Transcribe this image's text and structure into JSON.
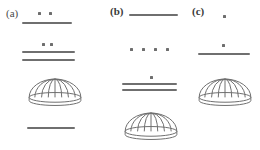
{
  "figure": {
    "stroke_color": "#6f6f6f",
    "dot_color": "#6e6e6e",
    "background": "#ffffff",
    "panels": [
      {
        "id": "a",
        "label": "(a)",
        "label_bold": false,
        "label_x": 6,
        "label_y": 8,
        "elements": [
          {
            "kind": "dots",
            "name": "dot-pair-top",
            "count": 2,
            "x": 38,
            "y": 11,
            "spacing": 11
          },
          {
            "kind": "line",
            "name": "rule-under-dot-pair",
            "x": 22,
            "y": 22,
            "width": 50
          },
          {
            "kind": "dots",
            "name": "dot-pair-middle",
            "count": 2,
            "x": 42,
            "y": 42,
            "spacing": 8
          },
          {
            "kind": "line",
            "name": "rule-middle-upper",
            "x": 22,
            "y": 51,
            "width": 53
          },
          {
            "kind": "line",
            "name": "rule-middle-lower",
            "x": 22,
            "y": 59,
            "width": 53
          },
          {
            "kind": "dome",
            "name": "dome-shape",
            "x": 28,
            "y": 78,
            "width": 54,
            "height": 28
          },
          {
            "kind": "line",
            "name": "rule-bottom",
            "x": 27,
            "y": 127,
            "width": 48
          }
        ]
      },
      {
        "id": "b",
        "label": "(b)",
        "label_bold": true,
        "label_x": 0,
        "label_y": 6,
        "elements": [
          {
            "kind": "line",
            "name": "rule-top",
            "x": 19,
            "y": 14,
            "width": 49
          },
          {
            "kind": "dots",
            "name": "dot-row-four",
            "count": 4,
            "x": 20,
            "y": 47,
            "spacing": 12
          },
          {
            "kind": "dots",
            "name": "dot-single-middle",
            "count": 1,
            "x": 40,
            "y": 75,
            "spacing": 0
          },
          {
            "kind": "line",
            "name": "rule-lower-upper",
            "x": 12,
            "y": 83,
            "width": 55
          },
          {
            "kind": "line",
            "name": "rule-lower-lower",
            "x": 12,
            "y": 89,
            "width": 55
          },
          {
            "kind": "dome",
            "name": "dome-shape",
            "x": 14,
            "y": 112,
            "width": 54,
            "height": 28
          }
        ]
      },
      {
        "id": "c",
        "label": "(c)",
        "label_bold": true,
        "label_x": 2,
        "label_y": 6,
        "elements": [
          {
            "kind": "dots",
            "name": "dot-single-top",
            "count": 1,
            "x": 33,
            "y": 14,
            "spacing": 0
          },
          {
            "kind": "dots",
            "name": "dot-single-middle",
            "count": 1,
            "x": 32,
            "y": 43,
            "spacing": 0
          },
          {
            "kind": "line",
            "name": "rule-under-dot",
            "x": 8,
            "y": 53,
            "width": 52
          },
          {
            "kind": "dome",
            "name": "dome-shape",
            "x": 8,
            "y": 78,
            "width": 54,
            "height": 28
          }
        ]
      }
    ]
  }
}
